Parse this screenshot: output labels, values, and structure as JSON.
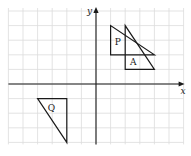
{
  "diagram": {
    "type": "coordinate-grid",
    "axes": {
      "x_label": "x",
      "y_label": "y",
      "x_range": [
        -6,
        6
      ],
      "y_range": [
        -4,
        5
      ],
      "origin_px": [
        96,
        84
      ],
      "unit_px": 14.6
    },
    "shapes": [
      {
        "label": "P",
        "vertices": [
          [
            1,
            4
          ],
          [
            1,
            2
          ],
          [
            4,
            2
          ]
        ],
        "label_pos": [
          1.5,
          2.7
        ]
      },
      {
        "label": "A",
        "vertices": [
          [
            2,
            4
          ],
          [
            2,
            1
          ],
          [
            4,
            1
          ]
        ],
        "label_pos": [
          2.55,
          1.3
        ]
      },
      {
        "label": "Q",
        "vertices": [
          [
            -4,
            -1
          ],
          [
            -2,
            -1
          ],
          [
            -2,
            -4
          ]
        ],
        "label_pos": [
          -3.05,
          -1.85
        ]
      }
    ],
    "colors": {
      "grid": "#dcdcdc",
      "lines": "#1a1a1a",
      "background": "#ffffff"
    }
  }
}
